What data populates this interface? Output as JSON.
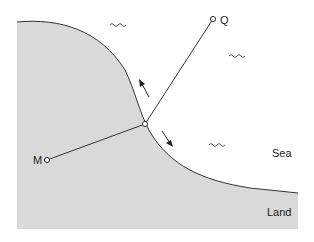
{
  "diagram": {
    "labels": {
      "q": "Q",
      "m": "M",
      "sea": "Sea",
      "land": "Land"
    },
    "points": {
      "p": {
        "x": 145,
        "y": 124
      },
      "q": {
        "x": 213,
        "y": 19
      },
      "m": {
        "x": 47,
        "y": 160
      }
    },
    "colors": {
      "land": "#d9d9d9",
      "sea": "#ffffff",
      "line": "#333333"
    },
    "wave_symbols": [
      "wave-1",
      "wave-2",
      "wave-3"
    ],
    "arrows": [
      "arrow-up-left",
      "arrow-down-right"
    ]
  }
}
